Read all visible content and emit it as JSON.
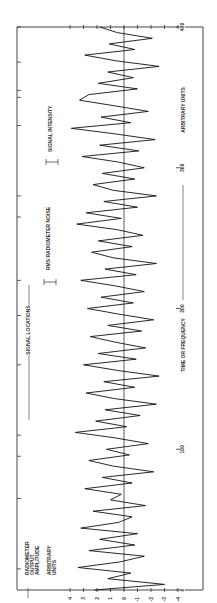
{
  "chart_data": {
    "type": "line",
    "orientation": "rotated-90-ccw",
    "title": "",
    "xlabel": "TIME OR FREQUENCY",
    "xlabel_units": "ARBITRARY UNITS",
    "ylabel": "RADIOMETER OUTPUT AMPLITUDE",
    "ylabel_units": "ARBITRARY UNITS",
    "xlim": [
      0,
      400
    ],
    "ylim": [
      -4,
      4
    ],
    "x_ticks": [
      0,
      100,
      200,
      300,
      400
    ],
    "x_tick_labels": [
      "0",
      "100",
      "200",
      "300",
      "400"
    ],
    "y_ticks": [
      4,
      3,
      2,
      1,
      0,
      -1,
      -2,
      -3,
      -4
    ],
    "y_tick_labels": [
      "4",
      "3",
      "2",
      "1",
      "0",
      "-1",
      "-2",
      "-3",
      "-4"
    ],
    "annotations": [
      {
        "text": "SIGNAL LOCATIONS",
        "type": "arrow-span"
      },
      {
        "text": "RMS RADIOMETER NOISE",
        "type": "error-bar"
      },
      {
        "text": "SIGNAL INTENSITY",
        "type": "error-bar"
      }
    ],
    "signal_locations_x": [
      15,
      65,
      95,
      110,
      160,
      195,
      220,
      265,
      280,
      330,
      350,
      355,
      375,
      400
    ],
    "series": [
      {
        "name": "radiometer output",
        "x": [
          0,
          4,
          8,
          12,
          16,
          20,
          24,
          28,
          32,
          36,
          40,
          44,
          48,
          52,
          56,
          60,
          64,
          68,
          72,
          76,
          80,
          84,
          88,
          92,
          96,
          100,
          104,
          108,
          112,
          116,
          120,
          124,
          128,
          132,
          136,
          140,
          144,
          148,
          152,
          156,
          160,
          164,
          168,
          172,
          176,
          180,
          184,
          188,
          192,
          196,
          200,
          204,
          208,
          212,
          216,
          220,
          224,
          228,
          232,
          236,
          240,
          244,
          248,
          252,
          256,
          260,
          264,
          268,
          272,
          276,
          280,
          284,
          288,
          292,
          296,
          300,
          304,
          308,
          312,
          316,
          320,
          324,
          328,
          332,
          336,
          340,
          344,
          348,
          352,
          356,
          360,
          364,
          368,
          372,
          376,
          380,
          384,
          388,
          392,
          396,
          400
        ],
        "values": [
          2.2,
          -3,
          1.2,
          -0.5,
          3.4,
          0.3,
          -1.5,
          2.6,
          -0.8,
          1.8,
          -1,
          3.2,
          0.4,
          -0.6,
          2.3,
          -1.6,
          1,
          0.2,
          2.9,
          -0.6,
          1.6,
          -2.2,
          0.8,
          2.6,
          -0.4,
          1.3,
          -1.8,
          0.6,
          3.6,
          -0.2,
          2.1,
          -1.2,
          1.4,
          -2.4,
          0.7,
          2.8,
          -0.8,
          1.5,
          -2.6,
          0.5,
          3,
          -0.9,
          1.9,
          -1.6,
          0.6,
          2.5,
          -1.3,
          1.2,
          -2.2,
          0.4,
          2.7,
          -0.7,
          1.7,
          -1.5,
          0.6,
          3.2,
          -0.9,
          1.4,
          -2.4,
          0.8,
          2.4,
          -0.6,
          1.9,
          -1.4,
          0.5,
          3.5,
          0.2,
          2.8,
          -1,
          1.5,
          -2.4,
          0.8,
          2.3,
          -0.8,
          1.6,
          -1.5,
          0.4,
          3.1,
          -1.1,
          1.8,
          -2.3,
          0.6,
          3.9,
          -0.5,
          1.7,
          -1.8,
          0.7,
          3.3,
          2.6,
          -1,
          1.9,
          -0.7,
          1.2,
          -2.6,
          0.6,
          2.9,
          -0.8,
          1.1,
          -2.1,
          0.5,
          1.8
        ]
      }
    ],
    "grid": false,
    "legend": null
  },
  "labels": {
    "x_axis": "TIME OR FREQUENCY",
    "x_units": "ARBITRARY UNITS",
    "y_axis_line1": "RADIOMETER",
    "y_axis_line2": "OUTPUT",
    "y_axis_line3": "AMPLITUDE",
    "y_units_line1": "ARBITRARY",
    "y_units_line2": "UNITS",
    "signal_locations": "SIGNAL LOCATIONS",
    "rms_noise": "RMS RADIOMETER NOISE",
    "signal_intensity": "SIGNAL INTENSITY"
  }
}
